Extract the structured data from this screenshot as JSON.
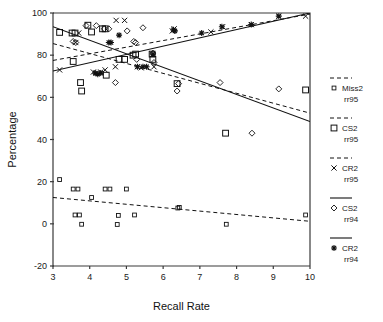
{
  "chart_data": {
    "type": "scatter",
    "title": "",
    "xlabel": "Recall Rate",
    "ylabel": "Percentage",
    "xlim": [
      3,
      10
    ],
    "ylim": [
      -20,
      100
    ],
    "xticks": [
      "3",
      "4",
      "5",
      "6",
      "7",
      "8",
      "9",
      "10"
    ],
    "yticks": [
      "100",
      "80",
      "60",
      "40",
      "20",
      "0",
      "-20"
    ],
    "grid": false,
    "legend_position": "right",
    "series": [
      {
        "name": "Miss2 rr95",
        "marker": "small-square",
        "line": "dashed",
        "points": [
          [
            3.18,
            21.0
          ],
          [
            3.55,
            16.5
          ],
          [
            3.68,
            16.5
          ],
          [
            3.6,
            4.2
          ],
          [
            3.72,
            4.2
          ],
          [
            3.78,
            -0.2
          ],
          [
            4.05,
            12.5
          ],
          [
            4.42,
            16.5
          ],
          [
            4.55,
            16.5
          ],
          [
            4.75,
            -0.3
          ],
          [
            4.78,
            4.0
          ],
          [
            5.0,
            16.5
          ],
          [
            5.22,
            4.2
          ],
          [
            6.4,
            7.5
          ],
          [
            6.44,
            7.8
          ],
          [
            7.72,
            -0.2
          ],
          [
            9.88,
            4.2
          ]
        ],
        "fit": {
          "x1": 3.0,
          "y1": 12.5,
          "x2": 10.0,
          "y2": 1.2
        }
      },
      {
        "name": "CS2 rr95",
        "marker": "square",
        "line": "dashed",
        "points": [
          [
            3.18,
            90.8
          ],
          [
            3.52,
            90.5
          ],
          [
            3.6,
            90.5
          ],
          [
            3.55,
            77.0
          ],
          [
            3.75,
            67.0
          ],
          [
            3.78,
            63.0
          ],
          [
            3.95,
            94.2
          ],
          [
            4.05,
            91.0
          ],
          [
            4.35,
            92.5
          ],
          [
            4.42,
            92.5
          ],
          [
            4.45,
            70.5
          ],
          [
            4.8,
            78.0
          ],
          [
            4.95,
            78.0
          ],
          [
            5.18,
            80.0
          ],
          [
            5.25,
            80.5
          ],
          [
            5.7,
            80.5
          ],
          [
            5.72,
            78.0
          ],
          [
            6.38,
            66.5
          ],
          [
            7.7,
            43.0
          ],
          [
            9.88,
            63.5
          ]
        ],
        "fit": {
          "x1": 3.0,
          "y1": 85.5,
          "x2": 10.0,
          "y2": 52.5
        }
      },
      {
        "name": "CR2 rr95",
        "marker": "cross",
        "line": "dashed",
        "points": [
          [
            3.18,
            73.0
          ],
          [
            3.62,
            86.0
          ],
          [
            3.7,
            90.5
          ],
          [
            4.1,
            72.0
          ],
          [
            4.18,
            71.5
          ],
          [
            4.3,
            72.0
          ],
          [
            4.42,
            73.0
          ],
          [
            4.72,
            96.5
          ],
          [
            4.95,
            96.5
          ],
          [
            4.7,
            74.5
          ],
          [
            5.3,
            74.5
          ],
          [
            5.4,
            74.0
          ],
          [
            5.75,
            74.5
          ],
          [
            6.25,
            91.5
          ],
          [
            6.3,
            92.5
          ],
          [
            7.3,
            91.0
          ],
          [
            7.62,
            93.5
          ],
          [
            8.4,
            94.5
          ],
          [
            9.15,
            98.5
          ],
          [
            9.88,
            98.5
          ]
        ],
        "fit": {
          "x1": 3.0,
          "y1": 77.5,
          "x2": 10.0,
          "y2": 99.5
        }
      },
      {
        "name": "CS2 rr94",
        "marker": "diamond",
        "line": "solid",
        "points": [
          [
            3.55,
            86.5
          ],
          [
            3.62,
            86.0
          ],
          [
            3.9,
            94.0
          ],
          [
            4.18,
            94.0
          ],
          [
            4.4,
            92.5
          ],
          [
            4.52,
            92.5
          ],
          [
            4.7,
            67.0
          ],
          [
            5.02,
            91.5
          ],
          [
            5.2,
            86.5
          ],
          [
            5.25,
            86.0
          ],
          [
            5.45,
            93.0
          ],
          [
            5.28,
            78.0
          ],
          [
            5.72,
            81.0
          ],
          [
            5.75,
            76.5
          ],
          [
            6.38,
            63.0
          ],
          [
            6.42,
            66.5
          ],
          [
            7.55,
            67.0
          ],
          [
            8.42,
            43.0
          ],
          [
            9.15,
            64.0
          ]
        ],
        "fit": {
          "x1": 3.0,
          "y1": 93.5,
          "x2": 10.0,
          "y2": 48.5
        }
      },
      {
        "name": "CR2 rr94",
        "marker": "star",
        "line": "solid",
        "points": [
          [
            4.15,
            71.5
          ],
          [
            4.22,
            71.0
          ],
          [
            4.3,
            71.5
          ],
          [
            4.52,
            86.0
          ],
          [
            4.58,
            86.0
          ],
          [
            4.8,
            89.5
          ],
          [
            5.3,
            74.5
          ],
          [
            5.45,
            74.5
          ],
          [
            5.55,
            74.5
          ],
          [
            6.28,
            92.0
          ],
          [
            6.32,
            91.5
          ],
          [
            7.05,
            90.5
          ],
          [
            7.6,
            93.5
          ],
          [
            8.4,
            94.5
          ],
          [
            9.15,
            98.5
          ],
          [
            5.72,
            80.5
          ]
        ],
        "fit": {
          "x1": 3.0,
          "y1": 72.5,
          "x2": 10.0,
          "y2": 100.0
        }
      }
    ]
  },
  "axes": {
    "ylabel": "Percentage",
    "xlabel": "Recall Rate",
    "xticks": [
      "3",
      "4",
      "5",
      "6",
      "7",
      "8",
      "9",
      "10"
    ],
    "yticks": [
      "100",
      "80",
      "60",
      "40",
      "20",
      "0",
      "-20"
    ]
  },
  "legend": {
    "entries": [
      {
        "label_line1": "Miss2",
        "label_line2": "rr95",
        "marker": "small-square",
        "line": "dashed"
      },
      {
        "label_line1": "CS2",
        "label_line2": "rr95",
        "marker": "square",
        "line": "dashed"
      },
      {
        "label_line1": "CR2",
        "label_line2": "rr95",
        "marker": "cross",
        "line": "dashed"
      },
      {
        "label_line1": "CS2",
        "label_line2": "rr94",
        "marker": "diamond",
        "line": "solid"
      },
      {
        "label_line1": "CR2",
        "label_line2": "rr94",
        "marker": "star",
        "line": "solid"
      }
    ]
  },
  "colors": {
    "ink": "#111111",
    "axis": "#3a3a3a",
    "background": "#ffffff"
  }
}
